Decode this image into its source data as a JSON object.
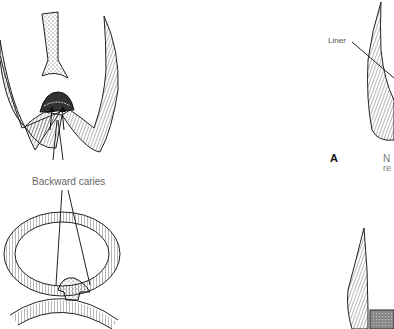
{
  "figure": {
    "left_panel": {
      "caption": "Backward caries",
      "top_drawing": "tooth-cross-section-pit-fissure",
      "bottom_drawing": "tooth-occlusal-caries-cone"
    },
    "right_panel": {
      "label_liner": "Liner",
      "panel_letter": "A",
      "truncated_text_line1": "N",
      "truncated_text_line2": "re"
    },
    "colors": {
      "line": "#222222",
      "hatch": "#333333",
      "background": "#ffffff",
      "text": "#555555"
    }
  }
}
